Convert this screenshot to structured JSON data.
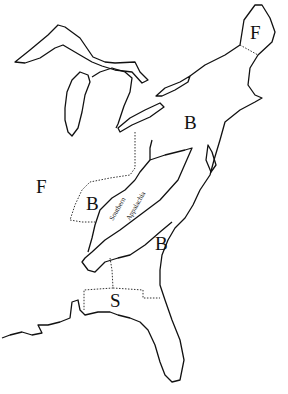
{
  "map": {
    "regions": [
      {
        "id": "f-northeast",
        "label": "F"
      },
      {
        "id": "b-northeast",
        "label": "B"
      },
      {
        "id": "f-west",
        "label": "F"
      },
      {
        "id": "b-west",
        "label": "B"
      },
      {
        "id": "b-south",
        "label": "B"
      },
      {
        "id": "s-southeast",
        "label": "S"
      }
    ],
    "annotations": {
      "appalachia_line1": "Southern",
      "appalachia_line2": "Appalachia"
    }
  }
}
